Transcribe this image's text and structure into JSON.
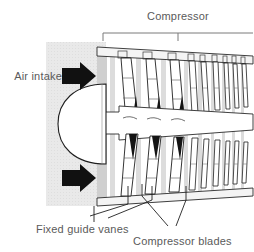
{
  "figure": {
    "background_color": "#ffffff",
    "panel_color": "#e8e8e8",
    "casing_band_color": "#b8b8b8",
    "line_color": "#1a1a1a",
    "text_color": "#5a5a5a"
  },
  "labels": {
    "compressor": "Compressor",
    "air_intake": "Air intake",
    "fixed_guide_vanes": "Fixed guide vanes",
    "compressor_blades": "Compressor blades"
  },
  "annotations": {
    "bracket": {
      "name": "compressor-bracket",
      "x_start": 103,
      "x_end": 253,
      "y": 33,
      "tick_x": 178,
      "tick_y": 40
    },
    "leaders": [
      {
        "name": "fixed-guide-vanes-leader-a",
        "x1": 93,
        "y1": 216,
        "x2": 122,
        "y2": 186
      },
      {
        "name": "fixed-guide-vanes-leader-b",
        "x1": 100,
        "y1": 214,
        "x2": 152,
        "y2": 186
      },
      {
        "name": "compressor-blades-leader-a",
        "x1": 168,
        "y1": 224,
        "x2": 140,
        "y2": 185
      },
      {
        "name": "compressor-blades-leader-b",
        "x1": 175,
        "y1": 224,
        "x2": 182,
        "y2": 186
      }
    ]
  },
  "arrows": [
    {
      "name": "air-intake-arrow-upper",
      "x": 66,
      "y": 76,
      "label": "Air intake"
    },
    {
      "name": "air-intake-arrow-lower",
      "x": 66,
      "y": 178,
      "label": "Air intake"
    }
  ],
  "nose_cone": {
    "name": "nose-cone",
    "tip_x": 48,
    "base_x": 105,
    "center_y": 124,
    "half_height": 40
  },
  "intake_panel": {
    "name": "air-intake-panel",
    "x": 46,
    "y": 42,
    "width": 60,
    "height": 164
  },
  "casing": {
    "name": "compressor-casing",
    "left_x": 97,
    "right_x": 253,
    "top_left_y": 47,
    "top_right_y": 56,
    "bottom_left_y": 206,
    "bottom_right_y": 196
  },
  "blade_stages": {
    "description": "Rows of compressor blades decreasing in size from front to rear",
    "upper": [
      {
        "name": "blade-upper-1",
        "x": 120,
        "width": 14,
        "top": 56,
        "bottom": 120
      },
      {
        "name": "blade-upper-2",
        "x": 145,
        "width": 13,
        "top": 57,
        "bottom": 118
      },
      {
        "name": "blade-upper-3",
        "x": 170,
        "width": 12,
        "top": 58,
        "bottom": 116
      },
      {
        "name": "blade-upper-4",
        "x": 190,
        "width": 8,
        "top": 59,
        "bottom": 112
      },
      {
        "name": "blade-upper-5",
        "x": 204,
        "width": 7,
        "top": 60,
        "bottom": 110
      },
      {
        "name": "blade-upper-6",
        "x": 216,
        "width": 6,
        "top": 61,
        "bottom": 108
      },
      {
        "name": "blade-upper-7",
        "x": 227,
        "width": 5,
        "top": 62,
        "bottom": 106
      },
      {
        "name": "blade-upper-8",
        "x": 236,
        "width": 5,
        "top": 63,
        "bottom": 105
      },
      {
        "name": "blade-upper-9",
        "x": 245,
        "width": 5,
        "top": 64,
        "bottom": 104
      }
    ],
    "lower": [
      {
        "name": "blade-lower-1",
        "x": 120,
        "width": 14,
        "top": 130,
        "bottom": 198
      },
      {
        "name": "blade-lower-2",
        "x": 145,
        "width": 13,
        "top": 131,
        "bottom": 196
      },
      {
        "name": "blade-lower-3",
        "x": 170,
        "width": 12,
        "top": 132,
        "bottom": 194
      },
      {
        "name": "blade-lower-4",
        "x": 190,
        "width": 8,
        "top": 134,
        "bottom": 190
      },
      {
        "name": "blade-lower-5",
        "x": 204,
        "width": 7,
        "top": 136,
        "bottom": 188
      },
      {
        "name": "blade-lower-6",
        "x": 216,
        "width": 6,
        "top": 137,
        "bottom": 186
      },
      {
        "name": "blade-lower-7",
        "x": 227,
        "width": 5,
        "top": 138,
        "bottom": 185
      },
      {
        "name": "blade-lower-8",
        "x": 236,
        "width": 5,
        "top": 139,
        "bottom": 184
      },
      {
        "name": "blade-lower-9",
        "x": 245,
        "width": 5,
        "top": 140,
        "bottom": 183
      }
    ]
  }
}
